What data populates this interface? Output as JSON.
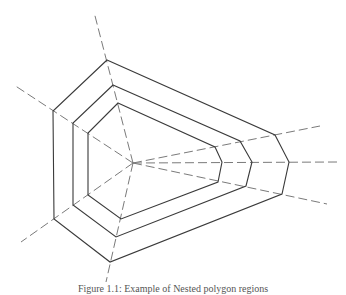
{
  "figure": {
    "caption": "Figure 1.1: Example of Nested polygon regions",
    "colors": {
      "background": "#ffffff",
      "polygon_stroke": "#3a3a3a",
      "ray_stroke": "#7a7a7a",
      "caption_text": "#555555"
    },
    "center": [
      133,
      163
    ],
    "rays": [
      {
        "name": "top",
        "to": [
          94,
          12
        ]
      },
      {
        "name": "upper-left",
        "to": [
          14,
          85
        ]
      },
      {
        "name": "lower-left",
        "to": [
          21,
          242
        ]
      },
      {
        "name": "bottom",
        "to": [
          106,
          282
        ]
      },
      {
        "name": "upper-right",
        "to": [
          320,
          126
        ]
      },
      {
        "name": "right",
        "to": [
          337,
          162
        ]
      },
      {
        "name": "lower-right",
        "to": [
          327,
          204
        ]
      }
    ],
    "polygons": [
      {
        "name": "outer",
        "points": [
          [
            107,
            60
          ],
          [
            275,
            135
          ],
          [
            289,
            162
          ],
          [
            282,
            194
          ],
          [
            110,
            262
          ],
          [
            54,
            219
          ],
          [
            53,
            111
          ]
        ]
      },
      {
        "name": "middle",
        "points": [
          [
            113,
            85
          ],
          [
            240,
            141
          ],
          [
            252,
            162
          ],
          [
            246,
            186
          ],
          [
            116,
            237
          ],
          [
            73,
            205
          ],
          [
            73,
            123
          ]
        ]
      },
      {
        "name": "inner",
        "points": [
          [
            118,
            103
          ],
          [
            215,
            147
          ],
          [
            222,
            162
          ],
          [
            218,
            182
          ],
          [
            121,
            219
          ],
          [
            88,
            195
          ],
          [
            88,
            133
          ]
        ]
      }
    ]
  }
}
